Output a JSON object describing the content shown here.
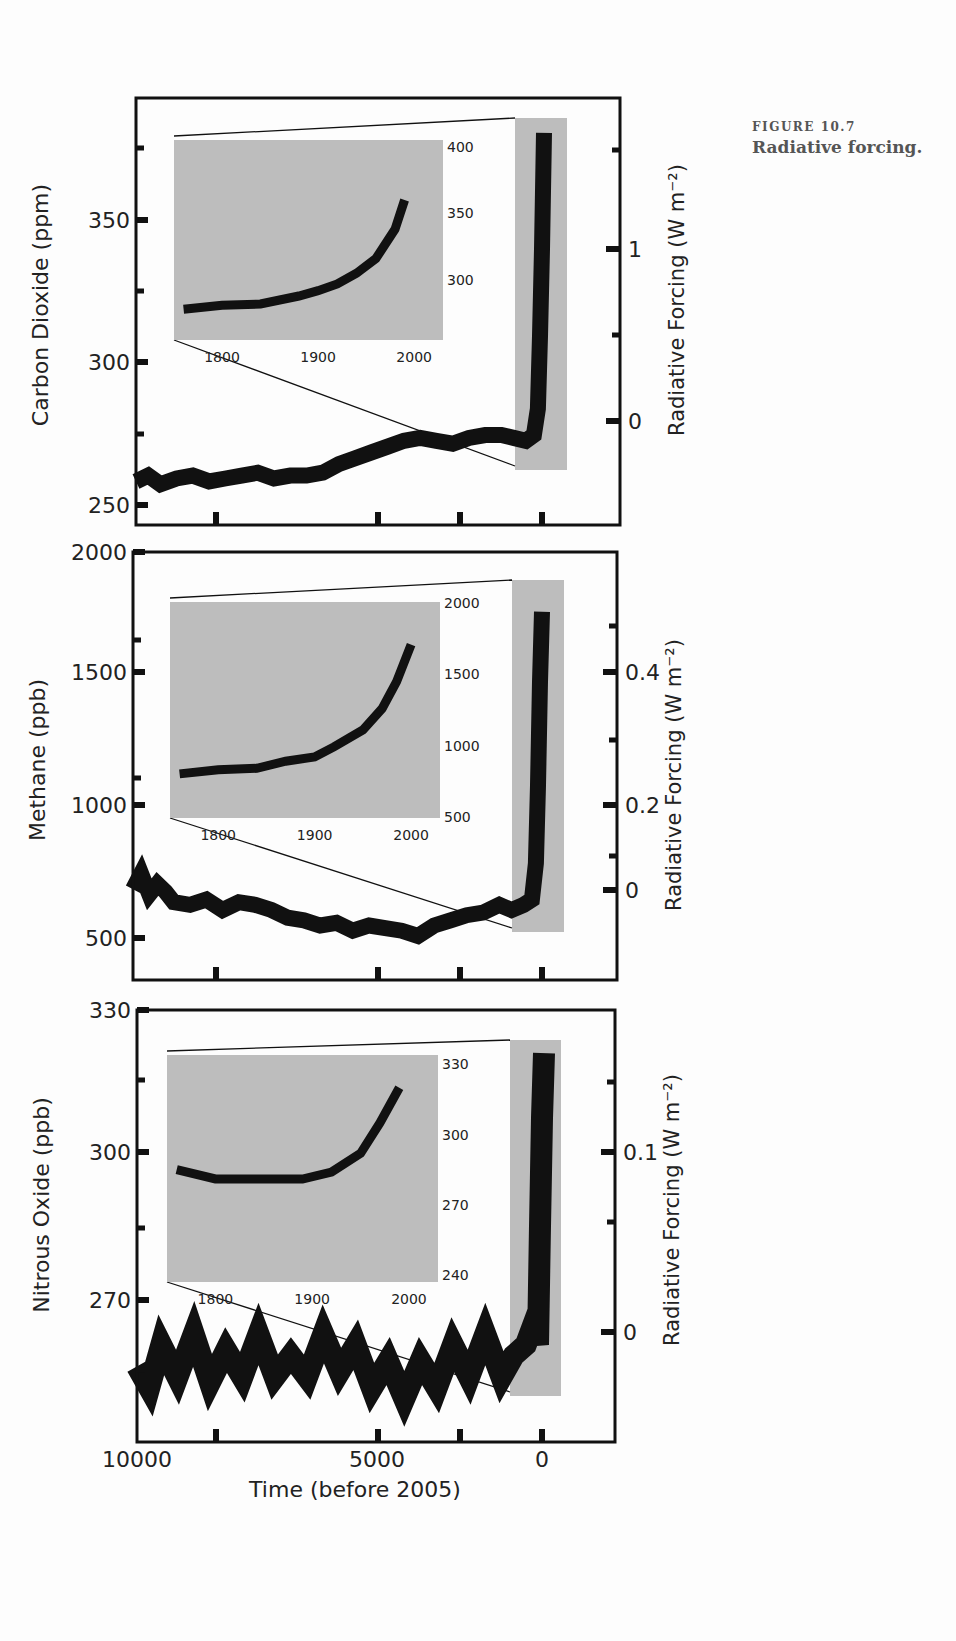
{
  "caption": {
    "figure_number": "FIGURE 10.7",
    "title": "Radiative forcing."
  },
  "colors": {
    "line": "#111111",
    "inset_bg": "#bdbdbd",
    "highlight_band": "#bdbdbd",
    "frame": "#111111",
    "background": "#fdfdfd"
  },
  "chart_data": [
    {
      "type": "line",
      "title": "Carbon Dioxide",
      "xlabel": "Time (before 2005)",
      "ylabel": "Carbon Dioxide (ppm)",
      "ylabel_right": "Radiative Forcing (W m-2)",
      "xlim": [
        10000,
        -1500
      ],
      "ylim": [
        245,
        392
      ],
      "yticks": [
        250,
        300,
        350
      ],
      "yticks_right": [
        {
          "label": "0",
          "value": 276
        },
        {
          "label": "1",
          "value": 330
        }
      ],
      "x": [
        10000,
        9700,
        9400,
        9000,
        8600,
        8200,
        7800,
        7400,
        7000,
        6600,
        6200,
        5800,
        5400,
        5000,
        4600,
        4200,
        3800,
        3400,
        3000,
        2600,
        2200,
        1800,
        1400,
        1000,
        700,
        400,
        200,
        100,
        50,
        0,
        -50
      ],
      "values": [
        260,
        262,
        259,
        261,
        262,
        260,
        261,
        262,
        263,
        261,
        262,
        262,
        263,
        266,
        268,
        270,
        272,
        274,
        275,
        274,
        273,
        275,
        276,
        276,
        275,
        274,
        276,
        285,
        310,
        340,
        380
      ],
      "inset": {
        "x": [
          1760,
          1800,
          1840,
          1880,
          1900,
          1920,
          1940,
          1960,
          1980,
          1990
        ],
        "values": [
          278,
          281,
          282,
          288,
          292,
          297,
          305,
          316,
          338,
          360
        ],
        "xticks": [
          1800,
          1900,
          2000
        ],
        "yticks": [
          300,
          350,
          400
        ],
        "xlim": [
          1750,
          2030
        ],
        "ylim": [
          255,
          405
        ]
      }
    },
    {
      "type": "line",
      "title": "Methane",
      "xlabel": "Time (before 2005)",
      "ylabel": "Methane (ppb)",
      "ylabel_right": "Radiative Forcing (W m-2)",
      "xlim": [
        10000,
        -1500
      ],
      "ylim": [
        350,
        2000
      ],
      "yticks": [
        500,
        1000,
        1500,
        2000
      ],
      "yticks_right": [
        {
          "label": "0",
          "value": 700
        },
        {
          "label": "0.2",
          "value": 1010
        },
        {
          "label": "0.4",
          "value": 1510
        }
      ],
      "x": [
        10000,
        9800,
        9600,
        9400,
        9200,
        9000,
        8600,
        8200,
        7800,
        7400,
        7000,
        6600,
        6200,
        5800,
        5400,
        5000,
        4600,
        4200,
        3800,
        3400,
        3000,
        2600,
        2200,
        1800,
        1400,
        1000,
        700,
        400,
        200,
        100,
        50,
        0,
        -50
      ],
      "values": [
        700,
        760,
        680,
        720,
        690,
        650,
        640,
        660,
        620,
        650,
        640,
        620,
        590,
        580,
        560,
        570,
        540,
        560,
        550,
        540,
        520,
        560,
        580,
        600,
        610,
        640,
        620,
        640,
        660,
        800,
        1100,
        1500,
        1770
      ],
      "inset": {
        "x": [
          1760,
          1800,
          1840,
          1870,
          1900,
          1920,
          1950,
          1970,
          1985,
          2000
        ],
        "values": [
          800,
          830,
          840,
          890,
          920,
          990,
          1110,
          1260,
          1450,
          1710
        ],
        "xticks": [
          1800,
          1900,
          2000
        ],
        "yticks": [
          500,
          1000,
          1500,
          2000
        ],
        "xlim": [
          1750,
          2030
        ],
        "ylim": [
          490,
          2010
        ]
      }
    },
    {
      "type": "line",
      "title": "Nitrous Oxide",
      "xlabel": "Time (before 2005)",
      "ylabel": "Nitrous Oxide (ppb)",
      "ylabel_right": "Radiative Forcing (W m-2)",
      "xlim": [
        10000,
        -1500
      ],
      "ylim": [
        250,
        330
      ],
      "yticks": [
        270,
        300,
        330
      ],
      "yticks_right": [
        {
          "label": "0",
          "value": 264
        },
        {
          "label": "0.1",
          "value": 300
        }
      ],
      "x": [
        10000,
        9700,
        9400,
        9000,
        8600,
        8200,
        7800,
        7400,
        7000,
        6600,
        6200,
        5800,
        5400,
        5000,
        4600,
        4200,
        3800,
        3400,
        3000,
        2600,
        2200,
        1800,
        1400,
        1000,
        700,
        400,
        200,
        100,
        50,
        0,
        -50
      ],
      "values": [
        264,
        260,
        268,
        262,
        270,
        261,
        267,
        262,
        270,
        262,
        266,
        262,
        270,
        263,
        268,
        260,
        265,
        258,
        265,
        260,
        268,
        262,
        270,
        262,
        266,
        268,
        272,
        268,
        290,
        310,
        322
      ],
      "inset": {
        "x": [
          1760,
          1800,
          1850,
          1890,
          1920,
          1950,
          1970,
          1990
        ],
        "values": [
          285,
          281,
          281,
          281,
          284,
          292,
          305,
          320
        ],
        "xticks": [
          1800,
          1900,
          2000
        ],
        "yticks": [
          240,
          270,
          300,
          330
        ],
        "xlim": [
          1750,
          2030
        ],
        "ylim": [
          237,
          334
        ]
      }
    }
  ],
  "axes": {
    "xticks": [
      "10000",
      "5000",
      "0"
    ],
    "xlabel": "Time (before 2005)",
    "panels": [
      {
        "ylabel": "Carbon Dioxide (ppm)",
        "yticks": [
          "250",
          "300",
          "350"
        ],
        "right_ticks": [
          "0",
          "1"
        ],
        "right_label": "Radiative Forcing (W m⁻²)",
        "inset_xticks": [
          "1800",
          "1900",
          "2000"
        ],
        "inset_yticks": [
          "300",
          "350",
          "400"
        ]
      },
      {
        "ylabel": "Methane (ppb)",
        "yticks": [
          "500",
          "1000",
          "1500",
          "2000"
        ],
        "right_ticks": [
          "0",
          "0.2",
          "0.4"
        ],
        "right_label": "Radiative Forcing (W m⁻²)",
        "inset_xticks": [
          "1800",
          "1900",
          "2000"
        ],
        "inset_yticks": [
          "500",
          "1000",
          "1500",
          "2000"
        ]
      },
      {
        "ylabel": "Nitrous Oxide (ppb)",
        "yticks": [
          "270",
          "300",
          "330"
        ],
        "right_ticks": [
          "0",
          "0.1"
        ],
        "right_label": "Radiative Forcing (W m⁻²)",
        "inset_xticks": [
          "1800",
          "1900",
          "2000"
        ],
        "inset_yticks": [
          "240",
          "270",
          "300",
          "330"
        ]
      }
    ]
  }
}
